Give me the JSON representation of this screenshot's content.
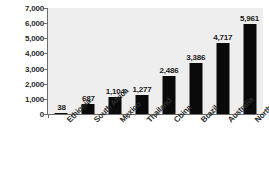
{
  "chart_data": {
    "type": "bar",
    "title": "",
    "subtitle": "",
    "xlabel": "",
    "ylabel": "cubic meters",
    "ylim": [
      0,
      7000
    ],
    "grid": false,
    "legend": false,
    "legend_position": "none",
    "orientation": "vertical",
    "bar_color": "#0a0a0a",
    "plot_background": "#eeeeee",
    "page_background": "#ffffff",
    "axis_color": "#6d6d6d",
    "y_ticks": [
      {
        "value": 7000,
        "label": "7,000"
      },
      {
        "value": 6000,
        "label": "6,000"
      },
      {
        "value": 5000,
        "label": "5,000"
      },
      {
        "value": 4000,
        "label": "4,000"
      },
      {
        "value": 3000,
        "label": "3,000"
      },
      {
        "value": 2000,
        "label": "2,000"
      },
      {
        "value": 1000,
        "label": "1,000"
      },
      {
        "value": 0,
        "label": "0"
      }
    ],
    "categories": [
      "Ethiopia",
      "South Africa",
      "Mexico",
      "Thailand",
      "China",
      "Brazil",
      "Australia",
      "North America"
    ],
    "values": [
      38,
      687,
      1104,
      1277,
      2486,
      3386,
      4717,
      5961
    ],
    "value_labels": [
      "38",
      "687",
      "1,104",
      "1,277",
      "2,486",
      "3,386",
      "4,717",
      "5,961"
    ],
    "points": [
      {
        "category": "Ethiopia",
        "value": 38,
        "label": "38"
      },
      {
        "category": "South Africa",
        "value": 687,
        "label": "687"
      },
      {
        "category": "Mexico",
        "value": 1104,
        "label": "1,104"
      },
      {
        "category": "Thailand",
        "value": 1277,
        "label": "1,277"
      },
      {
        "category": "China",
        "value": 2486,
        "label": "2,486"
      },
      {
        "category": "Brazil",
        "value": 3386,
        "label": "3,386"
      },
      {
        "category": "Australia",
        "value": 4717,
        "label": "4,717"
      },
      {
        "category": "North America",
        "value": 5961,
        "label": "5,961"
      }
    ]
  }
}
